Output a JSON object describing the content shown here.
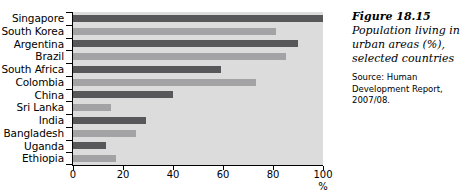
{
  "chart_data": {
    "type": "bar",
    "orientation": "horizontal",
    "title": "Population living in urban areas (%), selected countries",
    "xlabel": "%",
    "ylabel": "",
    "xlim": [
      0,
      100
    ],
    "xticks": [
      0,
      20,
      40,
      60,
      80,
      100
    ],
    "xtick_labels": [
      "0",
      "20",
      "40",
      "60",
      "80",
      "100"
    ],
    "grid": false,
    "legend": "none",
    "plot_background": "#dcdcdc",
    "bar_colors": [
      "#58585a",
      "#a3a3a5"
    ],
    "categories": [
      "Singapore",
      "South Korea",
      "Argentina",
      "Brazil",
      "South Africa",
      "Colombia",
      "China",
      "Sri Lanka",
      "India",
      "Bangladesh",
      "Uganda",
      "Ethiopia"
    ],
    "values": [
      100,
      81,
      90,
      85,
      59,
      73,
      40,
      15,
      29,
      25,
      13,
      17
    ]
  },
  "caption": {
    "figure_number": "Figure 18.15",
    "description": "Population living in urban areas (%), selected countries",
    "source": "Source: Human Development Report, 2007/08."
  }
}
